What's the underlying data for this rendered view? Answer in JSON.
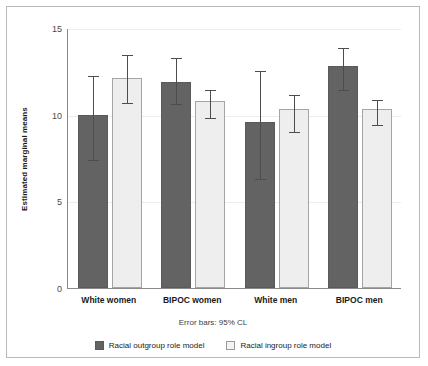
{
  "chart_data": {
    "type": "bar",
    "title": "",
    "xlabel": "",
    "ylabel": "Estimated marginal means",
    "ylim": [
      0,
      15
    ],
    "yticks": [
      0,
      5,
      10,
      15
    ],
    "grid": true,
    "legend_position": "bottom",
    "categories": [
      "White women",
      "BIPOC women",
      "White men",
      "BIPOC men"
    ],
    "series": [
      {
        "name": "Racial outgroup role model",
        "color": "#636363",
        "values": [
          10.0,
          11.9,
          9.6,
          12.8
        ],
        "error_low": [
          7.4,
          10.6,
          6.3,
          11.4
        ],
        "error_high": [
          12.3,
          13.3,
          12.6,
          13.9
        ]
      },
      {
        "name": "Racial ingroup role model",
        "color": "#eeeeee",
        "values": [
          12.1,
          10.8,
          10.3,
          10.3
        ],
        "error_low": [
          10.7,
          9.8,
          9.0,
          9.4
        ],
        "error_high": [
          13.5,
          11.5,
          11.2,
          10.9
        ]
      }
    ],
    "annotations": [
      "Error bars: 95% CL"
    ]
  },
  "axis": {
    "y_title": "Estimated marginal means",
    "y_tick_labels": [
      "0",
      "5",
      "10",
      "15"
    ]
  },
  "note": {
    "error_bars": "Error bars: 95% CL"
  },
  "legend": {
    "items": [
      {
        "label": "Racial outgroup role model"
      },
      {
        "label": "Racial ingroup role model"
      }
    ]
  }
}
